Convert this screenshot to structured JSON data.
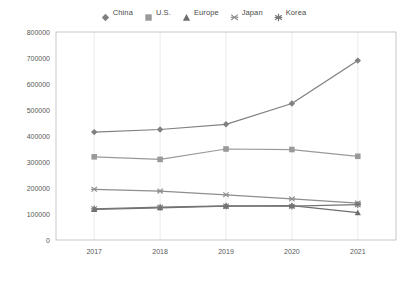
{
  "chart_data": {
    "type": "line",
    "title": "",
    "subtitle": "",
    "xlabel": "",
    "ylabel": "",
    "categories": [
      "2017",
      "2018",
      "2019",
      "2020",
      "2021"
    ],
    "x_tick_labels": [
      "2017",
      "2018",
      "2019",
      "2020",
      "2021"
    ],
    "y_tick_labels": [
      "0",
      "100000",
      "200000",
      "300000",
      "400000",
      "500000",
      "600000",
      "700000",
      "800000"
    ],
    "y_ticks": [
      0,
      100000,
      200000,
      300000,
      400000,
      500000,
      600000,
      700000,
      800000
    ],
    "ylim": [
      0,
      800000
    ],
    "grid": "vertical",
    "legend_position": "top-center",
    "series": [
      {
        "name": "China",
        "marker": "diamond",
        "color": "#808080",
        "values": [
          415000,
          425000,
          445000,
          525000,
          690000
        ]
      },
      {
        "name": "U.S.",
        "marker": "square",
        "color": "#9a9a9a",
        "values": [
          320000,
          310000,
          350000,
          348000,
          322000
        ]
      },
      {
        "name": "Europe",
        "marker": "triangle",
        "color": "#6e6e6e",
        "values": [
          118000,
          124000,
          130000,
          132000,
          105000
        ]
      },
      {
        "name": "Japan",
        "marker": "x",
        "color": "#8e8e8e",
        "values": [
          195000,
          188000,
          174000,
          158000,
          142000
        ]
      },
      {
        "name": "Korea",
        "marker": "asterisk",
        "color": "#757575",
        "values": [
          120000,
          126000,
          131000,
          130000,
          136000
        ]
      }
    ]
  },
  "legend": {
    "items": [
      {
        "label": "China",
        "marker": "diamond-marker-icon"
      },
      {
        "label": "U.S.",
        "marker": "square-marker-icon"
      },
      {
        "label": "Europe",
        "marker": "triangle-marker-icon"
      },
      {
        "label": "Japan",
        "marker": "x-marker-icon"
      },
      {
        "label": "Korea",
        "marker": "asterisk-marker-icon"
      }
    ]
  }
}
